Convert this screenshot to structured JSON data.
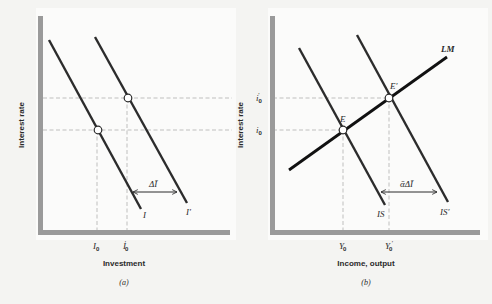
{
  "figure": {
    "background": "#f4f4f2",
    "panels": [
      {
        "id": "a",
        "caption": "(a)",
        "x_axis_title": "Investment",
        "y_axis_title": "Interest rate",
        "curves": [
          {
            "label": "I",
            "from": [
              49,
              40
            ],
            "to": [
              141,
              209
            ]
          },
          {
            "label": "I'",
            "from": [
              95,
              37
            ],
            "to": [
              187,
              203
            ]
          }
        ],
        "points": [
          {
            "name": "I0-point",
            "at": [
              98,
              130
            ]
          },
          {
            "name": "I0prime-point",
            "at": [
              128,
              98
            ]
          }
        ],
        "x_ticks": [
          {
            "base": "I",
            "sub": "0",
            "prime": "",
            "x": 97
          },
          {
            "base": "I",
            "sub": "0",
            "prime": "′",
            "x": 127
          }
        ],
        "shift_label": "ΔĪ"
      },
      {
        "id": "b",
        "caption": "(b)",
        "x_axis_title": "Income, output",
        "y_axis_title": "Interest rate",
        "curves": [
          {
            "label": "IS",
            "from": [
              299,
              48
            ],
            "to": [
              385,
              205
            ]
          },
          {
            "label": "IS'",
            "from": [
              357,
              35
            ],
            "to": [
              448,
              202
            ]
          },
          {
            "label": "LM",
            "from": [
              289,
              170
            ],
            "to": [
              447,
              57
            ]
          }
        ],
        "points": [
          {
            "label": "E",
            "at": [
              343,
              130
            ]
          },
          {
            "label": "E'",
            "at": [
              389,
              98
            ]
          }
        ],
        "x_ticks": [
          {
            "base": "Y",
            "sub": "0",
            "prime": "",
            "x": 343
          },
          {
            "base": "Y",
            "sub": "0",
            "prime": "′",
            "x": 389
          }
        ],
        "y_ticks": [
          {
            "base": "i",
            "sub": "0",
            "prime": "′",
            "y": 98
          },
          {
            "base": "i",
            "sub": "0",
            "prime": "",
            "y": 130
          }
        ],
        "shift_label": "ᾱΔĪ"
      }
    ],
    "labels": {
      "a_I": "I",
      "a_Iprime": "I′",
      "a_delta": "ΔĪ",
      "a_tick0_base": "I",
      "a_tick0_sub": "0",
      "a_tick1_base": "I",
      "a_tick1_sub": "0",
      "a_tick1_prime": "′",
      "a_xtitle": "Investment",
      "a_ytitle": "Interest rate",
      "a_caption": "(a)",
      "b_IS": "IS",
      "b_ISprime": "IS′",
      "b_LM": "LM",
      "b_E": "E",
      "b_Eprime": "E′",
      "b_delta": "ᾱΔĪ",
      "b_tick0_base": "Y",
      "b_tick0_sub": "0",
      "b_tick1_base": "Y",
      "b_tick1_sub": "0",
      "b_tick1_prime": "′",
      "b_i0_base": "i",
      "b_i0_sub": "0",
      "b_i0p_base": "i",
      "b_i0p_sub": "0",
      "b_i0p_prime": "′",
      "b_xtitle": "Income, output",
      "b_ytitle": "Interest rate",
      "b_caption": "(b)"
    }
  }
}
